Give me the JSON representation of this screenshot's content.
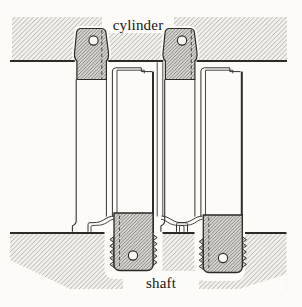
{
  "figure": {
    "labels": {
      "cylinder": "cylinder",
      "shaft": "shaft"
    },
    "colors": {
      "ink": "#2b2a27",
      "paper": "#fcfbf8",
      "band_fill": "#f2f1ec",
      "band_hatch": "#8f8f89",
      "part_fill": "#d7d6d0",
      "part_hatch": "#5f5f5b"
    },
    "components": [
      "cylinder wall (upper hatched band)",
      "shaft (lower hatched band)",
      "left fastener: T-head with hole, stepped sleeve, threaded stud with hole",
      "right fastener: T-head with hole, stepped sleeve, threaded stud with hole"
    ]
  }
}
